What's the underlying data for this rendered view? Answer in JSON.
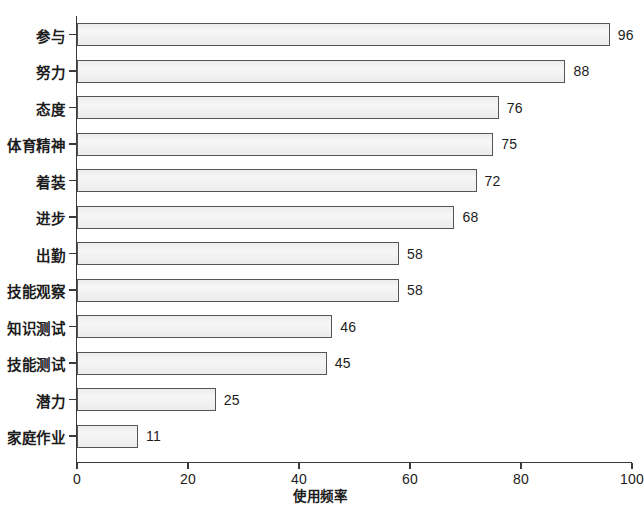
{
  "chart_data": {
    "type": "bar",
    "orientation": "horizontal",
    "title": "",
    "xlabel": "使用频率",
    "ylabel": "",
    "categories": [
      "参与",
      "努力",
      "态度",
      "体育精神",
      "着装",
      "进步",
      "出勤",
      "技能观察",
      "知识测试",
      "技能测试",
      "潜力",
      "家庭作业"
    ],
    "values": [
      96,
      88,
      76,
      75,
      72,
      68,
      58,
      58,
      46,
      45,
      25,
      11
    ],
    "value_labels": [
      "96",
      "88",
      "76",
      "75",
      "72",
      "68",
      "58",
      "58",
      "46",
      "45",
      "25",
      "11"
    ],
    "xlim": [
      0,
      100
    ],
    "xticks": [
      0,
      20,
      40,
      60,
      80,
      100
    ],
    "xtick_labels": [
      "0",
      "20",
      "40",
      "60",
      "80",
      "100"
    ],
    "grid": false,
    "legend": false,
    "bar_fill_color": "#ececec",
    "bar_border_color": "#555555",
    "axis_color": "#3a3a3a",
    "text_color": "#1c1c1c"
  }
}
